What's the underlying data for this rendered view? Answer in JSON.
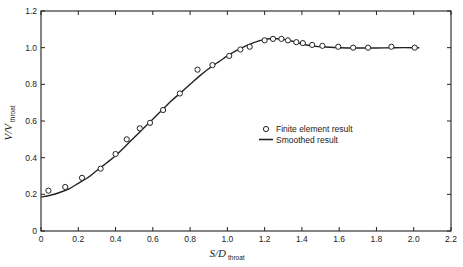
{
  "chart_data": {
    "type": "scatter",
    "title": "",
    "xlabel": "S/D",
    "xlabel_subscript": "throat",
    "ylabel": "V/V",
    "ylabel_subscript": "throat",
    "xlim": [
      0,
      2.2
    ],
    "ylim": [
      0,
      1.2
    ],
    "x_ticks": [
      "0",
      "0.2",
      "0.4",
      "0.6",
      "0.8",
      "1.0",
      "1.2",
      "1.4",
      "1.6",
      "1.8",
      "2.0",
      "2.2"
    ],
    "y_ticks": [
      "0",
      "0.2",
      "0.4",
      "0.6",
      "0.8",
      "1.0",
      "1.2"
    ],
    "grid": false,
    "legend_position": "center-right",
    "series": [
      {
        "name": "Finite element result",
        "kind": "markers",
        "marker": "open-circle",
        "x": [
          0.04,
          0.13,
          0.22,
          0.32,
          0.4,
          0.46,
          0.53,
          0.585,
          0.655,
          0.745,
          0.84,
          0.92,
          1.01,
          1.07,
          1.12,
          1.2,
          1.245,
          1.29,
          1.325,
          1.37,
          1.405,
          1.455,
          1.51,
          1.595,
          1.675,
          1.755,
          1.88,
          2.005
        ],
        "y": [
          0.22,
          0.24,
          0.29,
          0.34,
          0.42,
          0.5,
          0.56,
          0.59,
          0.66,
          0.75,
          0.88,
          0.905,
          0.955,
          0.99,
          1.005,
          1.04,
          1.048,
          1.048,
          1.04,
          1.03,
          1.025,
          1.015,
          1.01,
          1.005,
          1.0,
          1.0,
          1.005,
          1.0
        ]
      },
      {
        "name": "Smoothed result",
        "kind": "line",
        "x": [
          0.0,
          0.05,
          0.1,
          0.15,
          0.2,
          0.25,
          0.3,
          0.35,
          0.4,
          0.45,
          0.5,
          0.55,
          0.6,
          0.65,
          0.7,
          0.75,
          0.8,
          0.85,
          0.9,
          0.95,
          1.0,
          1.05,
          1.1,
          1.15,
          1.2,
          1.25,
          1.3,
          1.35,
          1.4,
          1.45,
          1.5,
          1.6,
          1.7,
          1.8,
          1.9,
          2.03
        ],
        "y": [
          0.185,
          0.195,
          0.21,
          0.23,
          0.26,
          0.29,
          0.33,
          0.37,
          0.41,
          0.46,
          0.51,
          0.56,
          0.61,
          0.66,
          0.71,
          0.755,
          0.8,
          0.845,
          0.885,
          0.92,
          0.955,
          0.985,
          1.01,
          1.03,
          1.045,
          1.05,
          1.045,
          1.035,
          1.02,
          1.01,
          1.005,
          1.0,
          0.998,
          0.998,
          1.0,
          1.0
        ]
      }
    ]
  },
  "legend": {
    "items": [
      {
        "label": "Finite element result",
        "symbol": "open-circle"
      },
      {
        "label": "Smoothed result",
        "symbol": "solid-line"
      }
    ]
  },
  "axes": {
    "x_title": "S/D",
    "x_title_sub": "throat",
    "y_title": "V/V",
    "y_title_sub": "throat"
  },
  "colors": {
    "ink": "#222222",
    "background": "#ffffff"
  }
}
